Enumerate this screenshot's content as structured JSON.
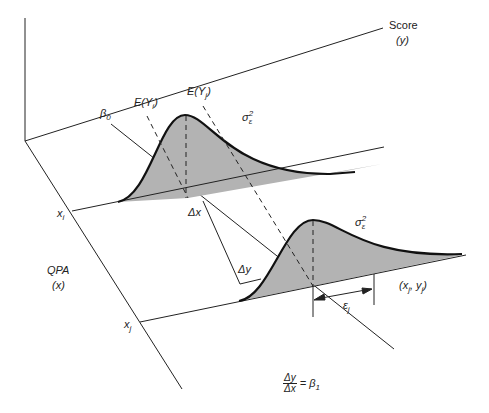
{
  "diagram": {
    "type": "regression-model-illustration",
    "axes": {
      "y_axis": {
        "label": "Score",
        "symbol": "(y)"
      },
      "x_axis": {
        "label": "QPA",
        "symbol": "(x)"
      }
    },
    "labels": {
      "beta0": "β",
      "beta0_sub": "0",
      "e_yi": "E(Y",
      "e_yi_sub": "i",
      "e_yj": "E(Y",
      "e_yj_sub": "j",
      "close_paren": ")",
      "sigma1": "σ",
      "sigma1_sup": "2",
      "sigma1_sub": "ε",
      "sigma2": "σ",
      "sigma2_sup": "2",
      "sigma2_sub": "ε",
      "xi": "x",
      "xi_sub": "i",
      "xj": "x",
      "xj_sub": "j",
      "delta_x": "Δx",
      "delta_y": "Δy",
      "point": "(x",
      "point_sub1": "j",
      "point_mid": ", y",
      "point_sub2": "j",
      "point_end": ")",
      "epsilon": "ε",
      "epsilon_sub": "j",
      "formula_num": "Δy",
      "formula_den": "Δx",
      "formula_rhs": "= β",
      "formula_rhs_sub": "1"
    },
    "colors": {
      "line": "#222222",
      "fill": "#b3b3b3",
      "background": "#ffffff"
    }
  }
}
